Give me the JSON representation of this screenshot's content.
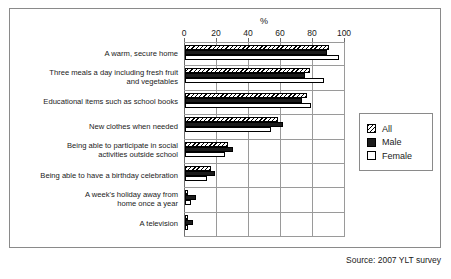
{
  "chart_data": {
    "type": "bar",
    "orientation": "horizontal",
    "title": "",
    "xlabel": "%",
    "ylabel": "",
    "xlim": [
      0,
      100
    ],
    "xticks": [
      0,
      20,
      40,
      60,
      80,
      100
    ],
    "grid": true,
    "legend_position": "right",
    "categories": [
      "A warm, secure home",
      "Three meals a day including fresh fruit and vegetables",
      "Educational items such as school books",
      "New clothes when needed",
      "Being able to participate in social activities outside school",
      "Being able to have a birthday celebration",
      "A week's holiday away from home once a year",
      "A television"
    ],
    "series": [
      {
        "name": "All",
        "values": [
          90,
          78,
          76,
          58,
          27,
          16,
          2,
          2
        ]
      },
      {
        "name": "Male",
        "values": [
          89,
          75,
          73,
          61,
          30,
          19,
          7,
          5
        ]
      },
      {
        "name": "Female",
        "values": [
          96,
          87,
          79,
          54,
          25,
          14,
          4,
          2
        ]
      }
    ]
  },
  "axis": {
    "unit_label": "%",
    "ticks": [
      "0",
      "20",
      "40",
      "60",
      "80",
      "100"
    ]
  },
  "categories": [
    {
      "lines": [
        "A warm, secure home"
      ]
    },
    {
      "lines": [
        "Three meals a day including fresh fruit",
        "and vegetables"
      ]
    },
    {
      "lines": [
        "Educational items such as school books"
      ]
    },
    {
      "lines": [
        "New clothes when needed"
      ]
    },
    {
      "lines": [
        "Being able to participate in social",
        "activities outside school"
      ]
    },
    {
      "lines": [
        "Being able to have a birthday celebration"
      ]
    },
    {
      "lines": [
        "A week's holiday away from",
        "home once a year"
      ]
    },
    {
      "lines": [
        "A television"
      ]
    }
  ],
  "legend": {
    "items": [
      {
        "label": "All",
        "pattern": "hatched"
      },
      {
        "label": "Male",
        "pattern": "solid-black"
      },
      {
        "label": "Female",
        "pattern": "white-outline"
      }
    ]
  },
  "source": {
    "text": "Source: 2007 YLT survey"
  },
  "colors": {
    "bar_outline": "#000000",
    "male_fill": "#1b1b1b",
    "female_fill": "#ffffff",
    "gridline": "#9a9a9a",
    "frame": "#8a8a8a"
  }
}
